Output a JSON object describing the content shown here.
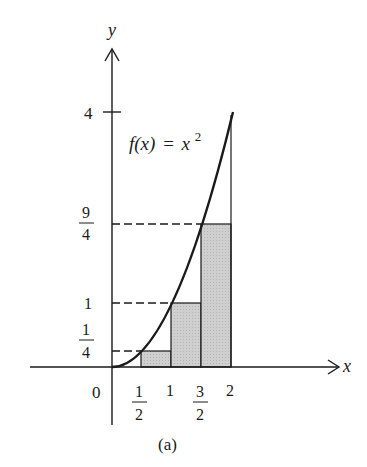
{
  "figure": {
    "caption": "(a)",
    "function_label": {
      "lhs": "f(x)",
      "eq": "=",
      "rhs_base": "x",
      "rhs_exp": "2"
    },
    "axes": {
      "x_label": "x",
      "y_label": "y",
      "origin_label": "0"
    },
    "x_ticks": [
      {
        "value": 0.5,
        "num": "1",
        "den": "2"
      },
      {
        "value": 1,
        "label": "1"
      },
      {
        "value": 1.5,
        "num": "3",
        "den": "2"
      },
      {
        "value": 2,
        "label": "2"
      }
    ],
    "y_ticks": [
      {
        "value": 0.25,
        "num": "1",
        "den": "4"
      },
      {
        "value": 1,
        "label": "1"
      },
      {
        "value": 2.25,
        "num": "9",
        "den": "4"
      },
      {
        "value": 4,
        "label": "4"
      }
    ],
    "rectangles": [
      {
        "x0": 0.5,
        "x1": 1,
        "height": 0.25
      },
      {
        "x0": 1,
        "x1": 1.5,
        "height": 1
      },
      {
        "x0": 1.5,
        "x1": 2,
        "height": 2.25
      }
    ],
    "colors": {
      "ink": "#1a1a1a",
      "fill": "#c8c8c8"
    }
  }
}
